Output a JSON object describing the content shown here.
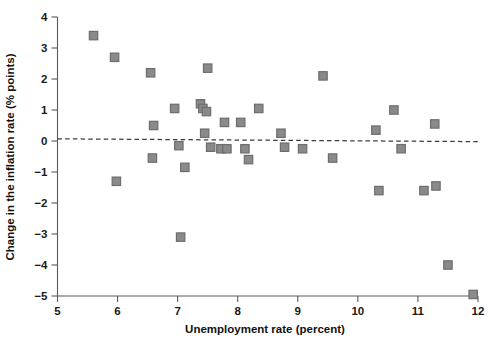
{
  "chart_data": {
    "type": "scatter",
    "title": "",
    "xlabel": "Unemployment rate (percent)",
    "ylabel": "Change in the inflation rate (% points)",
    "xlim": [
      5,
      12
    ],
    "ylim": [
      -5,
      4
    ],
    "xticks": [
      "5",
      "6",
      "7",
      "8",
      "9",
      "10",
      "11",
      "12"
    ],
    "yticks": [
      "4",
      "3",
      "2",
      "1",
      "0",
      "−1",
      "−2",
      "−3",
      "−4",
      "−5"
    ],
    "xtick_values": [
      5,
      6,
      7,
      8,
      9,
      10,
      11,
      12
    ],
    "ytick_values": [
      4,
      3,
      2,
      1,
      0,
      -1,
      -2,
      -3,
      -4,
      -5
    ],
    "grid": false,
    "legend": false,
    "marker_shape": "square",
    "marker_color": "#8a8a8a",
    "marker_edge_color": "#6d6d6d",
    "axis_color": "#5a5a5a",
    "points": [
      {
        "x": 5.6,
        "y": 3.4
      },
      {
        "x": 5.95,
        "y": 2.7
      },
      {
        "x": 5.98,
        "y": -1.3
      },
      {
        "x": 6.55,
        "y": 2.2
      },
      {
        "x": 6.6,
        "y": 0.5
      },
      {
        "x": 6.58,
        "y": -0.55
      },
      {
        "x": 6.95,
        "y": 1.05
      },
      {
        "x": 7.02,
        "y": -0.15
      },
      {
        "x": 7.05,
        "y": -3.1
      },
      {
        "x": 7.12,
        "y": -0.85
      },
      {
        "x": 7.38,
        "y": 1.2
      },
      {
        "x": 7.42,
        "y": 1.05
      },
      {
        "x": 7.48,
        "y": 0.95
      },
      {
        "x": 7.5,
        "y": 2.35
      },
      {
        "x": 7.45,
        "y": 0.25
      },
      {
        "x": 7.55,
        "y": -0.2
      },
      {
        "x": 7.72,
        "y": -0.25
      },
      {
        "x": 7.82,
        "y": -0.25
      },
      {
        "x": 7.78,
        "y": 0.6
      },
      {
        "x": 8.05,
        "y": 0.6
      },
      {
        "x": 8.12,
        "y": -0.25
      },
      {
        "x": 8.18,
        "y": -0.6
      },
      {
        "x": 8.35,
        "y": 1.05
      },
      {
        "x": 8.72,
        "y": 0.25
      },
      {
        "x": 8.78,
        "y": -0.2
      },
      {
        "x": 9.08,
        "y": -0.25
      },
      {
        "x": 9.42,
        "y": 2.1
      },
      {
        "x": 9.58,
        "y": -0.55
      },
      {
        "x": 10.3,
        "y": 0.35
      },
      {
        "x": 10.35,
        "y": -1.6
      },
      {
        "x": 10.6,
        "y": 1.0
      },
      {
        "x": 10.72,
        "y": -0.25
      },
      {
        "x": 11.1,
        "y": -1.6
      },
      {
        "x": 11.3,
        "y": -1.45
      },
      {
        "x": 11.28,
        "y": 0.55
      },
      {
        "x": 11.5,
        "y": -4.0
      },
      {
        "x": 11.92,
        "y": -4.95
      }
    ],
    "fit_line": {
      "type": "dashed-regression",
      "x_start": 5.0,
      "y_start": 0.07,
      "x_end": 12.0,
      "y_end": -0.02
    }
  }
}
